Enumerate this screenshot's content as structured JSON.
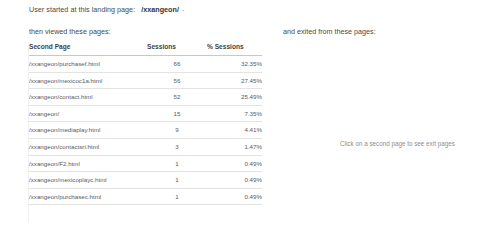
{
  "header": {
    "landing_prefix": "User started at this landing page:",
    "landing_page": "/xxangeon/",
    "landing_suffix": "-",
    "viewed_label": "then viewed these pages:",
    "exited_label": "and exited from these pages:"
  },
  "table": {
    "columns": {
      "page": "Second Page",
      "sessions": "Sessions",
      "percent": "% Sessions"
    },
    "rows": [
      {
        "page": "/xxangeon/purchasef.html",
        "sessions": "66",
        "percent": "32.35%"
      },
      {
        "page": "/xxangeon/mexicoc1a.html",
        "sessions": "56",
        "percent": "27.45%"
      },
      {
        "page": "/xxangeon/contact.html",
        "sessions": "52",
        "percent": "25.49%"
      },
      {
        "page": "/xxangeon/",
        "sessions": "15",
        "percent": "7.35%"
      },
      {
        "page": "/xxangeon/mediaplay.html",
        "sessions": "9",
        "percent": "4.41%"
      },
      {
        "page": "/xxangeon/contactsri.html",
        "sessions": "3",
        "percent": "1.47%"
      },
      {
        "page": "/xxangeon/F2.html",
        "sessions": "1",
        "percent": "0.49%"
      },
      {
        "page": "/xxangeon/mexicoplayc.html",
        "sessions": "1",
        "percent": "0.49%"
      },
      {
        "page": "/xxangeon/purchasec.html",
        "sessions": "1",
        "percent": "0.49%"
      }
    ]
  },
  "exit_panel": {
    "hint": "Click on a second page to see exit pages"
  },
  "colors": {
    "background": "#ffffff",
    "body_text": "#4a4a4a",
    "muted_text": "#8d8d8d",
    "header_rule": "#c8c8c8",
    "row_rule": "#e3e3e3"
  }
}
